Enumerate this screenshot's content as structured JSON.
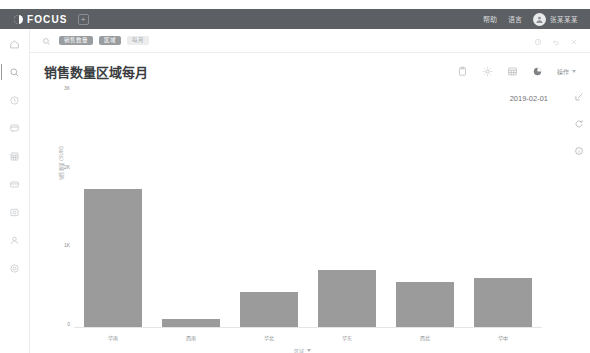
{
  "header": {
    "brand": "FOCUS",
    "plus_label": "+",
    "links": [
      "帮助",
      "语言"
    ],
    "user_name": "张某某某"
  },
  "sidebar": {
    "items": [
      {
        "name": "home",
        "label": "首页"
      },
      {
        "name": "search",
        "label": "搜索"
      },
      {
        "name": "history",
        "label": "历史"
      },
      {
        "name": "report",
        "label": "报表"
      },
      {
        "name": "table",
        "label": "数据表"
      },
      {
        "name": "card",
        "label": "卡片"
      },
      {
        "name": "image",
        "label": "图库"
      },
      {
        "name": "user",
        "label": "用户"
      },
      {
        "name": "settings",
        "label": "设置"
      }
    ]
  },
  "search": {
    "placeholder": "搜索",
    "chips": [
      {
        "label": "销售数量",
        "style": "solid"
      },
      {
        "label": "区域",
        "style": "solid"
      },
      {
        "label": "每月",
        "style": "ghost"
      }
    ]
  },
  "title_bar": {
    "title": "销售数量区域每月",
    "tools": [
      "clipboard-icon",
      "gear-icon",
      "table-icon",
      "pie-chart-icon"
    ],
    "menu_label": "操作"
  },
  "rail": {
    "items": [
      "expand-icon",
      "refresh-icon",
      "info-icon"
    ]
  },
  "chart_meta": {
    "date": "2019-02-01"
  },
  "chart_data": {
    "type": "bar",
    "title": "销售数量区域每月",
    "categories": [
      "华南",
      "西南",
      "华北",
      "华东",
      "西北",
      "华中"
    ],
    "values": [
      1760,
      105,
      450,
      720,
      575,
      625
    ],
    "series": [
      {
        "name": "销售数量",
        "values": [
          1760,
          105,
          450,
          720,
          575,
          625
        ]
      }
    ],
    "xlabel": "区域",
    "ylabel": "销售数量 (SUM)",
    "ylim": [
      0,
      3000
    ],
    "yticks": [
      0,
      1000,
      2000,
      3000
    ],
    "ytick_labels": [
      "0",
      "1K",
      "2K",
      "3K"
    ],
    "grid": false,
    "legend": false,
    "bar_color": "#9b9b9b"
  }
}
